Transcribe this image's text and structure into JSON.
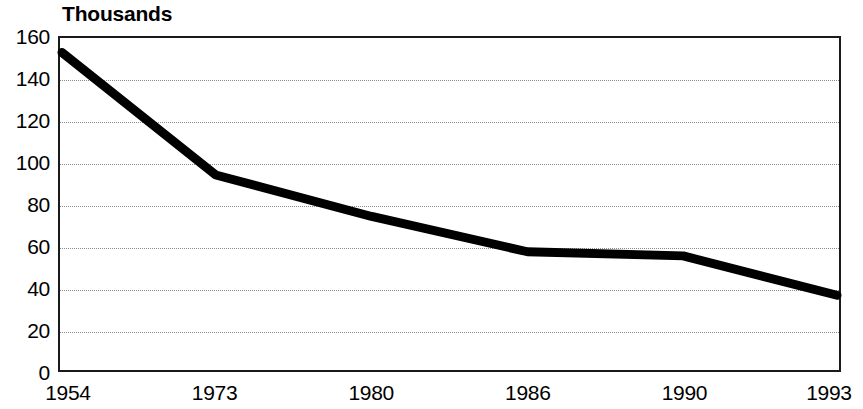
{
  "chart_data": {
    "type": "line",
    "title": "",
    "subtitle": "",
    "unit_label": "Thousands",
    "xlabel": "",
    "ylabel": "",
    "categories": [
      "1954",
      "1973",
      "1980",
      "1986",
      "1990",
      "1993"
    ],
    "values": [
      153,
      94,
      74,
      57,
      55,
      36
    ],
    "series": [
      {
        "name": "",
        "values": [
          153,
          94,
          74,
          57,
          55,
          36
        ]
      }
    ],
    "ylim": [
      0,
      160
    ],
    "ytick_step": 20,
    "yticks": [
      160,
      140,
      120,
      100,
      80,
      60,
      40,
      20,
      0
    ],
    "xticks": [
      "1954",
      "1973",
      "1980",
      "1986",
      "1990",
      "1993"
    ],
    "grid": true,
    "grid_axis": "y",
    "grid_style": "dotted",
    "legend": false,
    "legend_position": "none",
    "markers": false,
    "line_color": "#000000",
    "line_width": 9,
    "grid_color": "#8a8a8a",
    "axis_color": "#1a1a1a",
    "background_color": "#ffffff"
  }
}
